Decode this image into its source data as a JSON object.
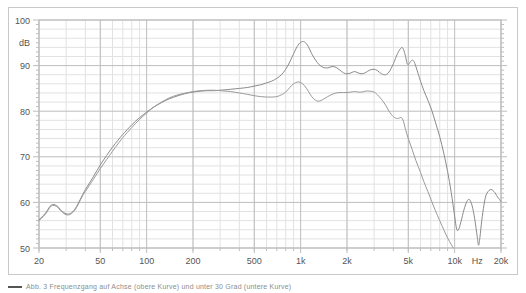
{
  "figure": {
    "caption": "Abb. 3  Frequenzgang auf Achse (obere Kurve) und unter 30 Grad (untere Kurve)",
    "caption_swatch_name": "curve-legend-swatch"
  },
  "chart_data": {
    "type": "line",
    "title": "",
    "subtitle": "",
    "xlabel": "Hz",
    "ylabel": "dB",
    "xscale": "log",
    "xlim": [
      20,
      20000
    ],
    "ylim": [
      50,
      100
    ],
    "grid": true,
    "legend_position": "none",
    "y_ticks": [
      50,
      60,
      70,
      80,
      90,
      100
    ],
    "y_tick_labels": [
      "50",
      "60",
      "70",
      "80",
      "90",
      "100"
    ],
    "y_minor_step": 2,
    "x_ticks": [
      20,
      50,
      100,
      200,
      500,
      1000,
      2000,
      5000,
      10000,
      20000
    ],
    "x_tick_labels": [
      "20",
      "50",
      "100",
      "200",
      "500",
      "1k",
      "2k",
      "5k",
      "10k",
      "20k"
    ],
    "x_unit_label": "Hz",
    "x_unit_label_position": 14000,
    "axis_label_db": "dB",
    "axis_label_db_value": 95,
    "colors": {
      "curve_on_axis": "#8a8a8a",
      "curve_off_axis": "#9a9a9a",
      "grid_major": "#bdbdbd",
      "grid_minor": "#e2e2e2",
      "frame": "#c9c9c9",
      "text": "#555555",
      "background": "#ffffff"
    },
    "series": [
      {
        "name": "On axis",
        "color": "#8a8a8a",
        "points": [
          [
            20,
            56.2
          ],
          [
            22,
            57.6
          ],
          [
            24,
            59.4
          ],
          [
            26,
            59.3
          ],
          [
            28,
            58.2
          ],
          [
            30,
            57.5
          ],
          [
            32,
            57.6
          ],
          [
            34,
            58.4
          ],
          [
            36,
            59.8
          ],
          [
            38,
            61.4
          ],
          [
            40,
            62.8
          ],
          [
            45,
            65.6
          ],
          [
            50,
            68.2
          ],
          [
            55,
            70.3
          ],
          [
            60,
            72.1
          ],
          [
            65,
            73.6
          ],
          [
            70,
            74.9
          ],
          [
            80,
            77.0
          ],
          [
            90,
            78.6
          ],
          [
            100,
            79.8
          ],
          [
            110,
            80.8
          ],
          [
            125,
            81.9
          ],
          [
            140,
            82.7
          ],
          [
            160,
            83.4
          ],
          [
            180,
            83.9
          ],
          [
            200,
            84.2
          ],
          [
            225,
            84.4
          ],
          [
            250,
            84.5
          ],
          [
            275,
            84.5
          ],
          [
            300,
            84.6
          ],
          [
            350,
            84.8
          ],
          [
            400,
            85.0
          ],
          [
            450,
            85.2
          ],
          [
            500,
            85.5
          ],
          [
            550,
            85.8
          ],
          [
            600,
            86.2
          ],
          [
            650,
            86.6
          ],
          [
            700,
            87.2
          ],
          [
            750,
            88.0
          ],
          [
            800,
            89.2
          ],
          [
            850,
            90.8
          ],
          [
            900,
            92.6
          ],
          [
            950,
            94.2
          ],
          [
            1000,
            95.1
          ],
          [
            1060,
            95.2
          ],
          [
            1120,
            94.2
          ],
          [
            1180,
            92.6
          ],
          [
            1250,
            91.2
          ],
          [
            1320,
            90.2
          ],
          [
            1400,
            89.6
          ],
          [
            1500,
            89.5
          ],
          [
            1600,
            89.8
          ],
          [
            1700,
            89.6
          ],
          [
            1800,
            89.0
          ],
          [
            1900,
            88.4
          ],
          [
            2000,
            88.2
          ],
          [
            2120,
            88.4
          ],
          [
            2240,
            88.7
          ],
          [
            2360,
            88.4
          ],
          [
            2500,
            88.2
          ],
          [
            2650,
            88.5
          ],
          [
            2800,
            89.0
          ],
          [
            3000,
            89.2
          ],
          [
            3150,
            88.9
          ],
          [
            3350,
            88.2
          ],
          [
            3550,
            88.0
          ],
          [
            3750,
            88.6
          ],
          [
            4000,
            90.4
          ],
          [
            4250,
            92.6
          ],
          [
            4500,
            93.9
          ],
          [
            4650,
            93.6
          ],
          [
            4800,
            92.0
          ],
          [
            4900,
            90.6
          ],
          [
            5000,
            90.2
          ],
          [
            5150,
            90.8
          ],
          [
            5300,
            91.2
          ],
          [
            5450,
            90.9
          ],
          [
            5600,
            89.8
          ],
          [
            5800,
            88.2
          ],
          [
            6000,
            86.6
          ],
          [
            6300,
            84.6
          ],
          [
            6700,
            82.4
          ],
          [
            7100,
            80.2
          ],
          [
            7500,
            77.6
          ],
          [
            8000,
            74.4
          ],
          [
            8500,
            70.8
          ],
          [
            9000,
            66.8
          ],
          [
            9500,
            62.2
          ],
          [
            10000,
            57.0
          ],
          [
            10300,
            54.2
          ],
          [
            10600,
            54.0
          ],
          [
            11000,
            55.8
          ],
          [
            11500,
            58.4
          ],
          [
            12000,
            60.2
          ],
          [
            12500,
            60.6
          ],
          [
            13000,
            59.2
          ],
          [
            13500,
            56.4
          ],
          [
            14000,
            52.6
          ],
          [
            14300,
            50.6
          ],
          [
            14600,
            52.4
          ],
          [
            15000,
            56.0
          ],
          [
            15500,
            59.4
          ],
          [
            16000,
            61.6
          ],
          [
            17000,
            62.8
          ],
          [
            18000,
            62.4
          ],
          [
            19000,
            61.2
          ],
          [
            20000,
            60.2
          ]
        ]
      },
      {
        "name": "Off axis 30 degrees",
        "color": "#9a9a9a",
        "points": [
          [
            20,
            56.0
          ],
          [
            22,
            57.4
          ],
          [
            24,
            59.2
          ],
          [
            26,
            59.1
          ],
          [
            28,
            58.0
          ],
          [
            30,
            57.3
          ],
          [
            32,
            57.4
          ],
          [
            34,
            58.2
          ],
          [
            36,
            59.6
          ],
          [
            38,
            61.2
          ],
          [
            40,
            62.4
          ],
          [
            45,
            65.0
          ],
          [
            50,
            67.4
          ],
          [
            55,
            69.4
          ],
          [
            60,
            71.2
          ],
          [
            65,
            72.8
          ],
          [
            70,
            74.2
          ],
          [
            80,
            76.4
          ],
          [
            90,
            78.2
          ],
          [
            100,
            79.6
          ],
          [
            110,
            80.8
          ],
          [
            125,
            82.0
          ],
          [
            140,
            82.9
          ],
          [
            160,
            83.6
          ],
          [
            180,
            84.0
          ],
          [
            200,
            84.3
          ],
          [
            225,
            84.5
          ],
          [
            250,
            84.6
          ],
          [
            275,
            84.6
          ],
          [
            300,
            84.5
          ],
          [
            350,
            84.3
          ],
          [
            400,
            84.0
          ],
          [
            450,
            83.7
          ],
          [
            500,
            83.4
          ],
          [
            550,
            83.2
          ],
          [
            600,
            83.1
          ],
          [
            650,
            83.1
          ],
          [
            700,
            83.2
          ],
          [
            750,
            83.6
          ],
          [
            800,
            84.2
          ],
          [
            850,
            85.2
          ],
          [
            900,
            86.0
          ],
          [
            950,
            86.4
          ],
          [
            1000,
            86.3
          ],
          [
            1060,
            85.6
          ],
          [
            1120,
            84.4
          ],
          [
            1180,
            83.2
          ],
          [
            1250,
            82.4
          ],
          [
            1320,
            82.2
          ],
          [
            1400,
            82.6
          ],
          [
            1500,
            83.2
          ],
          [
            1600,
            83.7
          ],
          [
            1700,
            84.0
          ],
          [
            1800,
            84.1
          ],
          [
            1900,
            84.1
          ],
          [
            2000,
            84.1
          ],
          [
            2120,
            84.2
          ],
          [
            2240,
            84.3
          ],
          [
            2360,
            84.2
          ],
          [
            2500,
            84.2
          ],
          [
            2650,
            84.4
          ],
          [
            2800,
            84.4
          ],
          [
            3000,
            84.2
          ],
          [
            3150,
            83.6
          ],
          [
            3350,
            82.6
          ],
          [
            3550,
            81.4
          ],
          [
            3750,
            80.0
          ],
          [
            4000,
            78.8
          ],
          [
            4250,
            78.4
          ],
          [
            4500,
            78.6
          ],
          [
            4650,
            77.8
          ],
          [
            4800,
            76.0
          ],
          [
            5000,
            74.0
          ],
          [
            5300,
            71.6
          ],
          [
            5600,
            69.2
          ],
          [
            6000,
            66.6
          ],
          [
            6300,
            64.6
          ],
          [
            6700,
            62.4
          ],
          [
            7100,
            60.2
          ],
          [
            7500,
            58.2
          ],
          [
            8000,
            56.0
          ],
          [
            8500,
            54.0
          ],
          [
            9000,
            52.2
          ],
          [
            9500,
            50.8
          ],
          [
            9800,
            50.0
          ]
        ]
      }
    ]
  }
}
